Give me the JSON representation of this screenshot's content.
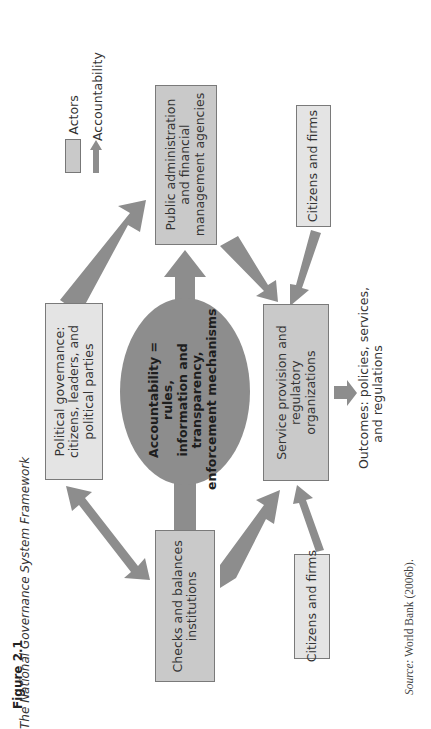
{
  "figure": {
    "number": "Figure 2.1",
    "title": "The National Governance System Framework",
    "source_label": "Source:",
    "source_text": "World Bank (2006b)."
  },
  "legend": {
    "actors_label": "Actors",
    "accountability_label": "Accountability"
  },
  "center": {
    "lines": [
      "Accountability =",
      "rules,",
      "information and",
      "transparency,",
      "enforcement mechanisms"
    ]
  },
  "nodes": {
    "public_admin": {
      "lines": [
        "Public administration",
        "and financial",
        "management agencies"
      ]
    },
    "political": {
      "lines": [
        "Political governance:",
        "citizens, leaders, and",
        "political parties"
      ]
    },
    "service": {
      "lines": [
        "Service provision and",
        "regulatory",
        "organizations"
      ]
    },
    "checks": {
      "lines": [
        "Checks and balances",
        "institutions"
      ]
    },
    "citizens_top": {
      "lines": [
        "Citizens and firms"
      ]
    },
    "citizens_bottom": {
      "lines": [
        "Citizens and firms"
      ]
    }
  },
  "outcomes": {
    "lines": [
      "Outcomes: policies, services,",
      "and regulations"
    ]
  },
  "colors": {
    "arrow": "#8d8d8d",
    "box_light": "#e4e4e4",
    "box_mid": "#c9c9c9",
    "ellipse": "#8d8d8d"
  }
}
